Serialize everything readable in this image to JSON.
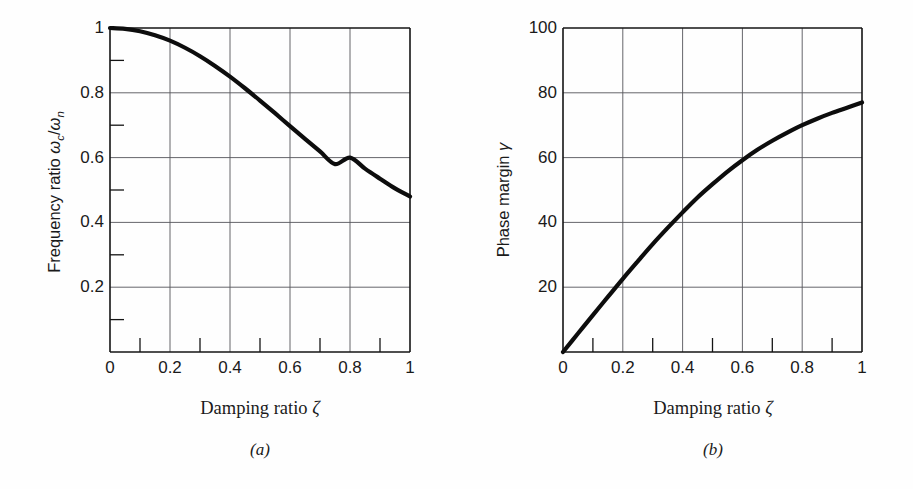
{
  "figure": {
    "background_color": "#fefefe",
    "curve_color": "#0d0d0d",
    "grid_color": "#55555a",
    "axis_color": "#141414"
  },
  "panels": [
    {
      "id": "a",
      "caption": "(a)",
      "xlabel_text": "Damping ratio ",
      "xlabel_symbol": "ζ",
      "ylabel_text": "Frequency ratio ",
      "ylabel_symbol_1": "ω",
      "ylabel_sub_1": "c",
      "ylabel_slash": "/",
      "ylabel_symbol_2": "ω",
      "ylabel_sub_2": "n",
      "x_ticks": [
        "0",
        "0.2",
        "0.4",
        "0.6",
        "0.8",
        "1.0"
      ],
      "y_ticks": [
        "0.2",
        "0.4",
        "0.6",
        "0.8",
        "1.0"
      ]
    },
    {
      "id": "b",
      "caption": "(b)",
      "xlabel_text": "Damping ratio ",
      "xlabel_symbol": "ζ",
      "ylabel_text": "Phase margin ",
      "ylabel_symbol_1": "γ",
      "x_ticks": [
        "0",
        "0.2",
        "0.4",
        "0.6",
        "0.8",
        "1.0"
      ],
      "y_ticks": [
        "20",
        "40",
        "60",
        "80",
        "100"
      ]
    }
  ],
  "chart_data": [
    {
      "type": "line",
      "panel": "a",
      "title": "",
      "xlabel": "Damping ratio ζ",
      "ylabel": "Frequency ratio ωc/ωn",
      "xlim": [
        0,
        1.0
      ],
      "ylim": [
        0,
        1.0
      ],
      "xticks": [
        0,
        0.2,
        0.4,
        0.6,
        0.8,
        1.0
      ],
      "yticks": [
        0.2,
        0.4,
        0.6,
        0.8,
        1.0
      ],
      "xminor": [
        0.1,
        0.3,
        0.5,
        0.7,
        0.9
      ],
      "yminor": [
        0.1,
        0.3,
        0.5,
        0.7,
        0.9
      ],
      "grid": true,
      "legend": "none",
      "series": [
        {
          "name": "ωc/ωn vs ζ",
          "x": [
            0.0,
            0.05,
            0.1,
            0.15,
            0.2,
            0.25,
            0.3,
            0.35,
            0.4,
            0.45,
            0.5,
            0.55,
            0.6,
            0.65,
            0.7,
            0.75,
            0.8,
            0.85,
            0.9,
            0.95,
            1.0
          ],
          "y": [
            1.0,
            0.9975,
            0.99,
            0.9775,
            0.961,
            0.939,
            0.913,
            0.883,
            0.85,
            0.814,
            0.776,
            0.737,
            0.697,
            0.658,
            0.619,
            0.58,
            0.6,
            0.566,
            0.535,
            0.505,
            0.48
          ]
        }
      ],
      "notes": "Monotonic decreasing curve from 1.0 at damping ratio 0 to about 0.48 at damping ratio 1.0; crosses 0.8 near ζ=0.47 and 0.6 near ζ=0.80."
    },
    {
      "type": "line",
      "panel": "b",
      "title": "",
      "xlabel": "Damping ratio ζ",
      "ylabel": "Phase margin γ",
      "xlim": [
        0,
        1.0
      ],
      "ylim": [
        0,
        100
      ],
      "xticks": [
        0,
        0.2,
        0.4,
        0.6,
        0.8,
        1.0
      ],
      "yticks": [
        20,
        40,
        60,
        80,
        100
      ],
      "xminor": [
        0.1,
        0.3,
        0.5,
        0.7,
        0.9
      ],
      "grid": true,
      "legend": "none",
      "series": [
        {
          "name": "Phase margin γ vs ζ",
          "x": [
            0.0,
            0.05,
            0.1,
            0.15,
            0.2,
            0.25,
            0.3,
            0.35,
            0.4,
            0.45,
            0.5,
            0.55,
            0.6,
            0.65,
            0.7,
            0.75,
            0.8,
            0.85,
            0.9,
            0.95,
            1.0
          ],
          "y": [
            0,
            5.7,
            11.4,
            17.0,
            22.6,
            28.0,
            33.3,
            38.3,
            43.1,
            47.7,
            51.8,
            55.7,
            59.2,
            62.4,
            65.2,
            67.7,
            70.0,
            72.0,
            73.8,
            75.4,
            77.0
          ]
        }
      ],
      "notes": "Monotonic increasing, nearly linear near origin then saturating; passes 20 near ζ=0.17, 40 near ζ=0.37, 60 near ζ=0.61, and reaches about 77 at ζ=1.0."
    }
  ]
}
